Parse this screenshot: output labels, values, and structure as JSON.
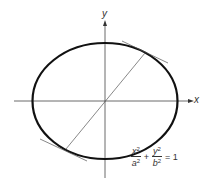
{
  "diagram": {
    "axes": {
      "x_label": "x",
      "y_label": "y"
    },
    "equation": {
      "term1": {
        "num": "x",
        "num_exp": "2",
        "den": "a",
        "den_exp": "2"
      },
      "plus": "+",
      "term2": {
        "num": "y",
        "num_exp": "2",
        "den": "b",
        "den_exp": "2"
      },
      "equals": "= 1"
    },
    "colors": {
      "ellipse": "#111111",
      "lines": "#444444",
      "background": "#ffffff"
    }
  }
}
